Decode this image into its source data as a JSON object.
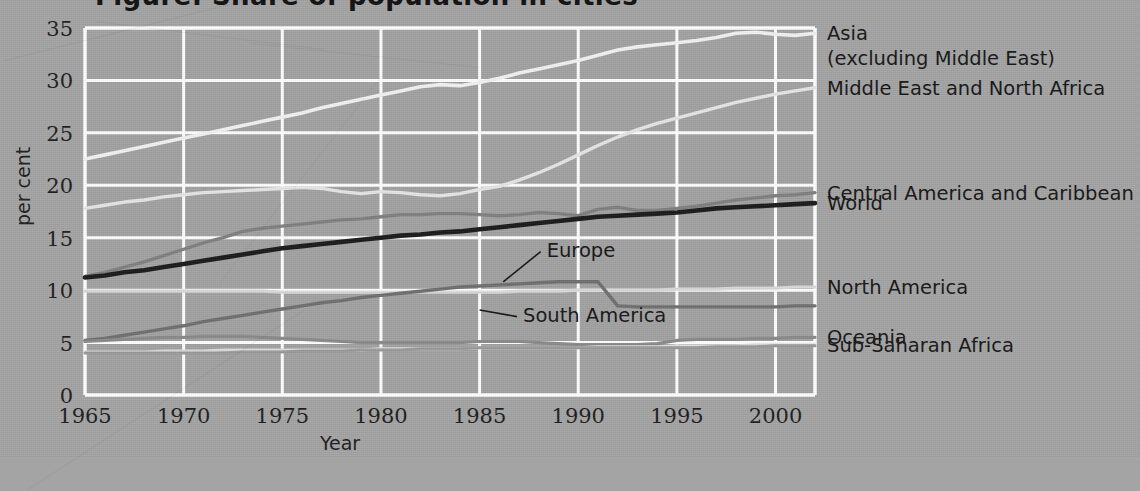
{
  "figure": {
    "title_fragment": "Figure: Share of population in cities",
    "background_color": "#a4a4a4",
    "grid_color": "#ffffff"
  },
  "chart_data": {
    "type": "line",
    "title": "",
    "xlabel": "Year",
    "ylabel": "per cent",
    "xlim": [
      1965,
      2002
    ],
    "ylim": [
      0,
      35
    ],
    "xticks": [
      1965,
      1970,
      1975,
      1980,
      1985,
      1990,
      1995,
      2000
    ],
    "xtick_labels": [
      "1965",
      "1970",
      "1975",
      "1980",
      "1985",
      "1990",
      "1995",
      "2000"
    ],
    "yticks": [
      0,
      5,
      10,
      15,
      20,
      25,
      30,
      35
    ],
    "ytick_labels": [
      "0",
      "5",
      "10",
      "15",
      "20",
      "25",
      "30",
      "35"
    ],
    "grid": true,
    "legend_position": "right-axis",
    "x": [
      1965,
      1966,
      1967,
      1968,
      1969,
      1970,
      1971,
      1972,
      1973,
      1974,
      1975,
      1976,
      1977,
      1978,
      1979,
      1980,
      1981,
      1982,
      1983,
      1984,
      1985,
      1986,
      1987,
      1988,
      1989,
      1990,
      1991,
      1992,
      1993,
      1994,
      1995,
      1996,
      1997,
      1998,
      1999,
      2000,
      2001,
      2002
    ],
    "series": [
      {
        "name": "Asia (excluding Middle East)",
        "color": "#f2f2f2",
        "width": 3.6,
        "values": [
          22.5,
          22.9,
          23.3,
          23.7,
          24.1,
          24.5,
          24.9,
          25.3,
          25.7,
          26.1,
          26.5,
          26.9,
          27.4,
          27.8,
          28.2,
          28.6,
          29.0,
          29.4,
          29.6,
          29.5,
          29.8,
          30.2,
          30.7,
          31.1,
          31.5,
          31.9,
          32.4,
          32.9,
          33.2,
          33.4,
          33.6,
          33.8,
          34.1,
          34.5,
          34.6,
          34.4,
          34.3,
          34.5
        ]
      },
      {
        "name": "Middle East and North Africa",
        "color": "#e6e6e6",
        "width": 3.4,
        "values": [
          17.8,
          18.1,
          18.4,
          18.6,
          18.9,
          19.1,
          19.3,
          19.4,
          19.5,
          19.6,
          19.7,
          19.8,
          19.7,
          19.4,
          19.2,
          19.4,
          19.3,
          19.1,
          19.0,
          19.2,
          19.6,
          19.9,
          20.5,
          21.2,
          22.0,
          22.9,
          23.8,
          24.6,
          25.3,
          25.9,
          26.4,
          26.9,
          27.4,
          27.9,
          28.3,
          28.7,
          29.0,
          29.3
        ]
      },
      {
        "name": "Central America and Caribbean",
        "color": "#808080",
        "width": 3.4,
        "values": [
          11.3,
          11.7,
          12.2,
          12.7,
          13.3,
          13.9,
          14.5,
          15.0,
          15.6,
          15.9,
          16.1,
          16.3,
          16.5,
          16.7,
          16.8,
          17.0,
          17.2,
          17.2,
          17.3,
          17.3,
          17.2,
          17.1,
          17.2,
          17.4,
          17.3,
          17.1,
          17.7,
          17.9,
          17.6,
          17.6,
          17.8,
          18.0,
          18.3,
          18.6,
          18.8,
          19.0,
          19.1,
          19.3
        ]
      },
      {
        "name": "World",
        "color": "#1a1a1a",
        "width": 4.6,
        "values": [
          11.2,
          11.4,
          11.7,
          11.9,
          12.2,
          12.5,
          12.8,
          13.1,
          13.4,
          13.7,
          14.0,
          14.2,
          14.4,
          14.6,
          14.8,
          15.0,
          15.2,
          15.3,
          15.5,
          15.6,
          15.8,
          16.0,
          16.2,
          16.4,
          16.6,
          16.8,
          17.0,
          17.1,
          17.2,
          17.3,
          17.4,
          17.6,
          17.8,
          17.9,
          18.0,
          18.1,
          18.2,
          18.3
        ]
      },
      {
        "name": "North America",
        "color": "#d9d9d9",
        "width": 3.2,
        "values": [
          9.9,
          9.9,
          9.9,
          9.9,
          9.9,
          9.9,
          9.9,
          9.9,
          9.9,
          9.9,
          9.8,
          9.8,
          9.8,
          9.8,
          9.8,
          9.8,
          9.8,
          9.8,
          9.8,
          9.8,
          9.8,
          9.8,
          9.9,
          9.9,
          9.9,
          10.0,
          10.0,
          10.0,
          10.0,
          10.0,
          10.1,
          10.1,
          10.1,
          10.2,
          10.2,
          10.2,
          10.3,
          10.3
        ]
      },
      {
        "name": "Europe",
        "color": "#6f6f6f",
        "width": 3.4,
        "values": [
          5.2,
          5.4,
          5.7,
          6.0,
          6.3,
          6.6,
          7.0,
          7.3,
          7.6,
          7.9,
          8.2,
          8.5,
          8.8,
          9.0,
          9.3,
          9.5,
          9.7,
          9.9,
          10.1,
          10.3,
          10.4,
          10.5,
          10.6,
          10.7,
          10.8,
          10.8,
          10.8,
          8.5,
          8.4,
          8.4,
          8.4,
          8.4,
          8.4,
          8.4,
          8.4,
          8.4,
          8.5,
          8.5
        ]
      },
      {
        "name": "South America",
        "color": "#8a8a8a",
        "width": 3.2,
        "values": [
          5.1,
          5.2,
          5.3,
          5.4,
          5.5,
          5.5,
          5.6,
          5.6,
          5.6,
          5.5,
          5.4,
          5.3,
          5.2,
          5.1,
          5.0,
          5.0,
          5.0,
          5.0,
          5.0,
          5.0,
          5.1,
          5.1,
          5.1,
          5.0,
          4.9,
          4.8,
          4.8,
          4.8,
          4.8,
          4.9,
          5.2,
          5.3,
          5.3,
          5.3,
          5.4,
          5.4,
          5.5,
          5.5
        ]
      },
      {
        "name": "Oceania",
        "color": "#dcdcdc",
        "width": 3.0,
        "values": [
          4.1,
          4.1,
          4.1,
          4.1,
          4.2,
          4.2,
          4.2,
          4.3,
          4.3,
          4.3,
          4.3,
          4.3,
          4.3,
          4.3,
          4.3,
          4.4,
          4.4,
          4.4,
          4.4,
          4.4,
          4.5,
          4.5,
          4.5,
          4.5,
          4.5,
          4.5,
          4.6,
          4.6,
          4.6,
          4.6,
          4.7,
          4.7,
          4.7,
          4.7,
          4.8,
          4.8,
          4.8,
          4.8
        ]
      },
      {
        "name": "Sub-Saharan Africa",
        "color": "#9a9a9a",
        "width": 3.0,
        "values": [
          4.0,
          4.0,
          4.0,
          4.0,
          4.0,
          4.0,
          4.0,
          4.0,
          4.1,
          4.1,
          4.1,
          4.2,
          4.2,
          4.2,
          4.3,
          4.3,
          4.3,
          4.4,
          4.4,
          4.4,
          4.5,
          4.5,
          4.5,
          4.5,
          4.5,
          4.5,
          4.5,
          4.5,
          4.5,
          4.5,
          4.5,
          4.5,
          4.6,
          4.6,
          4.6,
          4.7,
          4.7,
          4.7
        ]
      }
    ],
    "right_labels": [
      {
        "id": "asia",
        "line1": "Asia",
        "line2": "(excluding Middle East)",
        "y_value": 34.5
      },
      {
        "id": "mena",
        "line1": "Middle East and North Africa",
        "line2": "",
        "y_value": 29.3
      },
      {
        "id": "central-america",
        "line1": "Central America and Caribbean",
        "line2": "",
        "y_value": 19.3
      },
      {
        "id": "world",
        "line1": "World",
        "line2": "",
        "y_value": 18.3
      },
      {
        "id": "north-america",
        "line1": "North America",
        "line2": "",
        "y_value": 10.3
      },
      {
        "id": "oceania",
        "line1": "Oceania",
        "line2": "",
        "y_value": 5.5
      },
      {
        "id": "sub-saharan-africa",
        "line1": "Sub-Saharan Africa",
        "line2": "",
        "y_value": 4.8
      }
    ],
    "annotations": [
      {
        "id": "europe",
        "label": "Europe",
        "text_x": 1988.4,
        "text_y": 13.2,
        "point_x": 1986.2,
        "point_y": 10.8
      },
      {
        "id": "south-america",
        "label": "South America",
        "text_x": 1987.2,
        "text_y": 7.0,
        "point_x": 1985.0,
        "point_y": 8.1
      }
    ]
  }
}
